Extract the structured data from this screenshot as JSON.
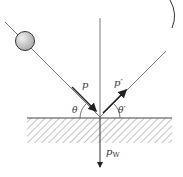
{
  "diagram": {
    "labels": {
      "incident_momentum": "p",
      "reflected_momentum": "p′",
      "incident_angle": "θ",
      "reflected_angle": "θ′",
      "wall_momentum_main": "p",
      "wall_momentum_sub": "W"
    },
    "colors": {
      "line": "#444444",
      "ball_fill": "#c8c8c8",
      "ball_stroke": "#333333",
      "hatch": "#666666"
    }
  }
}
